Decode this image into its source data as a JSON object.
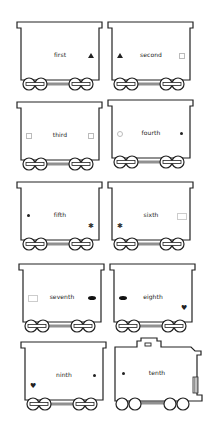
{
  "worksheet": {
    "cars": [
      {
        "label": "first",
        "left_mark": "none",
        "right_mark": "triangle"
      },
      {
        "label": "second",
        "left_mark": "triangle",
        "right_mark": "square"
      },
      {
        "label": "third",
        "left_mark": "square",
        "right_mark": "square"
      },
      {
        "label": "fourth",
        "left_mark": "circle-open",
        "right_mark": "dot"
      },
      {
        "label": "fifth",
        "left_mark": "dot",
        "right_mark": "star"
      },
      {
        "label": "sixth",
        "left_mark": "star",
        "right_mark": "rectangle"
      },
      {
        "label": "seventh",
        "left_mark": "rectangle",
        "right_mark": "ellipse"
      },
      {
        "label": "eighth",
        "left_mark": "ellipse",
        "right_mark": "heart"
      },
      {
        "label": "ninth",
        "left_mark": "heart",
        "right_mark": "dot"
      },
      {
        "label": "tenth",
        "left_mark": "dot",
        "right_mark": "none",
        "type": "engine"
      }
    ],
    "glyphs": {
      "star": "✱",
      "heart": "♥"
    },
    "colors": {
      "line": "#222222",
      "background": "#ffffff"
    }
  }
}
